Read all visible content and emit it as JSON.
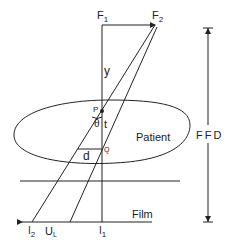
{
  "diagram": {
    "labels": {
      "focus_1": "F",
      "focus_1_sub": "1",
      "focus_2": "F",
      "focus_2_sub": "2",
      "distance_y": "y",
      "point_p": "P",
      "angle_theta": "θ",
      "thickness_t": "t",
      "point_q": "Q",
      "distance_d": "d",
      "patient": "Patient",
      "ffd": "FFD",
      "film": "Film",
      "image_2": "I",
      "image_2_sub": "2",
      "unsharpness": "U",
      "unsharpness_sub": "L",
      "image_1": "I",
      "image_1_sub": "1"
    }
  }
}
